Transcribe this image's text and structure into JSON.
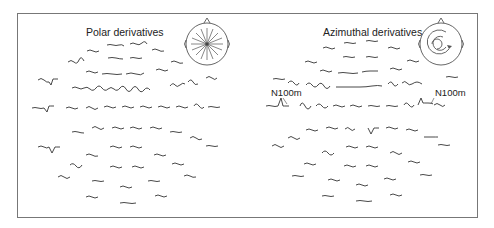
{
  "figure": {
    "panels": [
      {
        "id": "polar",
        "title": "Polar derivatives",
        "head_icon": "radial-arrows-head-icon",
        "labels": []
      },
      {
        "id": "azimuthal",
        "title": "Azimuthal derivatives",
        "head_icon": "circular-arrows-head-icon",
        "labels": [
          "N100m",
          "N100m"
        ]
      }
    ]
  }
}
